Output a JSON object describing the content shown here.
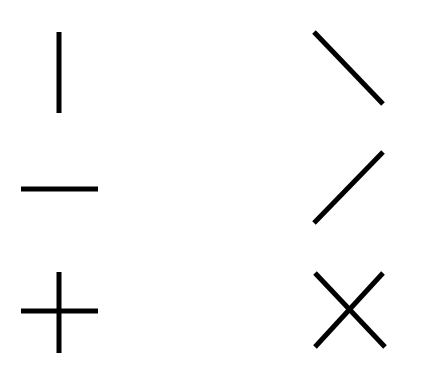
{
  "diagram": {
    "title": "",
    "stroke_color": "#000000",
    "background_color": "#ffffff",
    "stroke_width": 5,
    "shapes": [
      {
        "name": "vertical-line",
        "lines": [
          {
            "x1": 59,
            "y1": 32,
            "x2": 59,
            "y2": 113
          }
        ]
      },
      {
        "name": "horizontal-line",
        "lines": [
          {
            "x1": 21,
            "y1": 189,
            "x2": 98,
            "y2": 189
          }
        ]
      },
      {
        "name": "plus-sign",
        "lines": [
          {
            "x1": 59,
            "y1": 272,
            "x2": 59,
            "y2": 353
          },
          {
            "x1": 21,
            "y1": 311,
            "x2": 98,
            "y2": 311
          }
        ]
      },
      {
        "name": "backslash-diagonal",
        "lines": [
          {
            "x1": 314,
            "y1": 32,
            "x2": 383,
            "y2": 104
          }
        ]
      },
      {
        "name": "slash-diagonal",
        "lines": [
          {
            "x1": 383,
            "y1": 152,
            "x2": 314,
            "y2": 223
          }
        ]
      },
      {
        "name": "x-cross",
        "lines": [
          {
            "x1": 315,
            "y1": 273,
            "x2": 385,
            "y2": 347
          },
          {
            "x1": 383,
            "y1": 273,
            "x2": 315,
            "y2": 347
          }
        ]
      }
    ]
  }
}
